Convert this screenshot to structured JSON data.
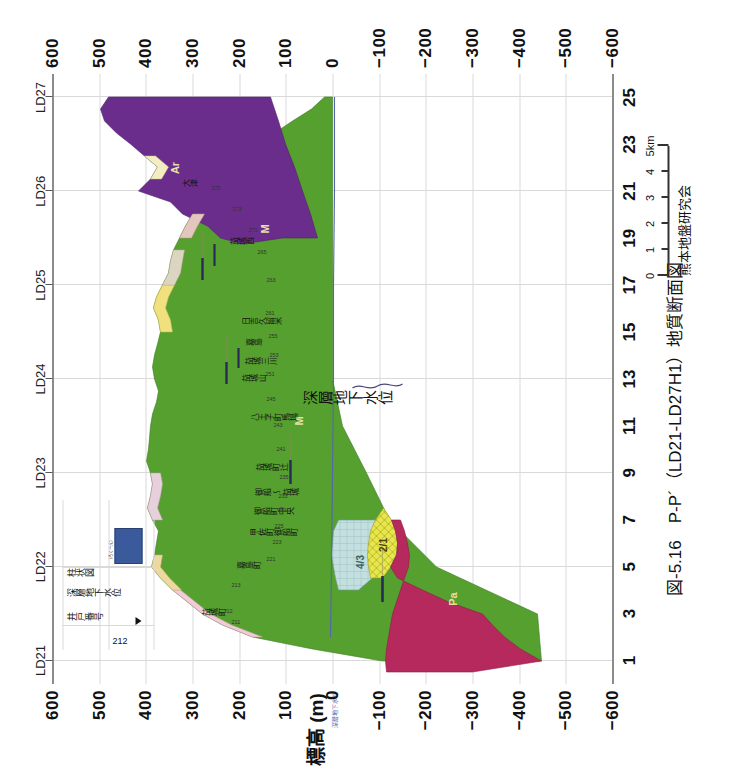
{
  "figure": {
    "caption": "図-5.16　P-P´（LD21-LD27H1）地質断面図",
    "organization": "熊本地盤研究会"
  },
  "axes": {
    "y_title": "標高 (m)",
    "y_ticks": [
      "600",
      "500",
      "400",
      "300",
      "200",
      "100",
      "0",
      "−100",
      "−200",
      "−300",
      "−400",
      "−500",
      "−600"
    ],
    "y_values": [
      600,
      500,
      400,
      300,
      200,
      100,
      0,
      -100,
      -200,
      -300,
      -400,
      -500,
      -600
    ],
    "y_range": [
      -600,
      600
    ],
    "x_ticks": [
      "1",
      "3",
      "5",
      "7",
      "9",
      "11",
      "13",
      "15",
      "17",
      "19",
      "21",
      "23",
      "25"
    ],
    "x_values": [
      1,
      3,
      5,
      7,
      9,
      11,
      13,
      15,
      17,
      19,
      21,
      23,
      25
    ],
    "x_range": [
      0,
      26
    ],
    "section_labels": [
      "LD21",
      "LD22",
      "LD23",
      "LD24",
      "LD25",
      "LD26",
      "LD27"
    ],
    "section_positions": [
      1,
      5,
      9,
      13,
      17,
      21,
      25
    ]
  },
  "scalebar": {
    "ticks": [
      "0",
      "1",
      "2",
      "3",
      "4",
      "5km"
    ],
    "values": [
      0,
      1,
      2,
      3,
      4,
      5
    ],
    "unit": "km"
  },
  "legend": {
    "well_number_label": "井戸番号",
    "well_number_value": "212",
    "groundwater_label": "深層地下水位",
    "column_label": "柱状図",
    "column_caption": "（ろくーん）",
    "swatch_color": "#3b5a9b"
  },
  "annotations": {
    "groundwater_callout": "深層地下水位",
    "groundwater_axis_note": "深層地下水位"
  },
  "units": [
    {
      "code": "Ar",
      "name": "阿蘇火砕流堆積物",
      "color": "#6B2D8C",
      "label_x": 22.0,
      "label_y": -40
    },
    {
      "code": "M",
      "name": "砥川溶岩・布田層",
      "color": "#56A030",
      "label_x": 19.4,
      "label_y": -90
    },
    {
      "code": "M",
      "name": "砥川溶岩・布田層",
      "color": "#56A030",
      "label_x": 11.2,
      "label_y": -130
    },
    {
      "code": "Pa",
      "name": "先阿蘇火山岩類",
      "color": "#B5295C",
      "label_x": 3.6,
      "label_y": -160
    },
    {
      "code": "4/3",
      "name": "第4/第3帯水層",
      "color": "#BFDCDC",
      "label_x": 5.2,
      "label_y": -40
    },
    {
      "code": "2/1",
      "name": "第2/第1帯水層",
      "color": "#E4E24A",
      "label_x": 5.9,
      "label_y": -118
    }
  ],
  "chart_data": {
    "type": "area",
    "title": "図-5.16　P-P´（LD21-LD27H1）地質断面図",
    "xlabel": "",
    "ylabel": "標高 (m)",
    "xlim": [
      0,
      26
    ],
    "ylim": [
      -600,
      600
    ],
    "grid": true,
    "legend_position": "inset-upper-left",
    "series": [
      {
        "name": "地表面（標高）",
        "unit": "m",
        "x": [
          2.0,
          2.4,
          2.8,
          3.2,
          3.6,
          4.0,
          4.4,
          4.8,
          5.2,
          5.6,
          6.0,
          6.6,
          7.2,
          7.8,
          8.4,
          9.0,
          9.6,
          10.2,
          10.8,
          11.4,
          12.0,
          12.6,
          13.2,
          13.8,
          14.4,
          15.0,
          15.6,
          16.2,
          16.8,
          17.4,
          18.0,
          18.6,
          19.2,
          19.8,
          20.4,
          21.0,
          21.6,
          22.2,
          22.8,
          23.4,
          24.0,
          24.6,
          25.2
        ],
        "y": [
          195,
          165,
          175,
          190,
          195,
          190,
          150,
          120,
          95,
          88,
          82,
          78,
          72,
          70,
          68,
          65,
          70,
          75,
          78,
          80,
          92,
          100,
          96,
          88,
          86,
          92,
          98,
          95,
          90,
          96,
          105,
          118,
          130,
          150,
          175,
          205,
          245,
          290,
          265,
          320,
          370,
          390,
          395
        ]
      },
      {
        "name": "阿蘇火砕流堆積物 (Ar) 基底",
        "unit": "m",
        "x": [
          19.0,
          20.0,
          21.0,
          22.0,
          23.0,
          24.0,
          25.2
        ],
        "y": [
          25,
          10,
          -10,
          -40,
          -80,
          -130,
          -185
        ]
      },
      {
        "name": "砥川溶岩・布田層 (M) 基底",
        "unit": "m",
        "x": [
          1.0,
          3.0,
          5.0,
          7.0,
          9.0,
          11.0,
          13.0,
          15.0,
          17.0,
          19.0,
          21.0,
          23.0,
          25.2
        ],
        "y": [
          -505,
          -500,
          -365,
          -290,
          -255,
          -205,
          -200,
          -200,
          -200,
          -200,
          -200,
          -200,
          -200
        ]
      },
      {
        "name": "先阿蘇火山岩類 (Pa) 上面",
        "unit": "m",
        "x": [
          1.0,
          2.0,
          3.0,
          4.0,
          5.0,
          5.6
        ],
        "y": [
          -500,
          -300,
          -220,
          -180,
          -150,
          -120
        ]
      },
      {
        "name": "深層地下水位",
        "unit": "m",
        "x": [
          2.0,
          5.0,
          9.0,
          13.0,
          17.0,
          21.0,
          25.0
        ],
        "y": [
          8,
          6,
          5,
          4,
          4,
          3,
          2
        ]
      }
    ]
  },
  "places": [
    {
      "label": "益城町",
      "x": 3.0
    },
    {
      "label": "嘉島町",
      "x": 5.0
    },
    {
      "label": "甲佐町御船町",
      "x": 6.4
    },
    {
      "label": "御船町中央",
      "x": 7.3
    },
    {
      "label": "御船 ～ 益城",
      "x": 8.1
    },
    {
      "label": "益城町辻",
      "x": 9.2
    },
    {
      "label": "八王子町馬場",
      "x": 11.3
    },
    {
      "label": "益城山",
      "x": 13.0
    },
    {
      "label": "益城三川",
      "x": 13.7
    },
    {
      "label": "嘉島",
      "x": 14.5
    },
    {
      "label": "日吉久留米",
      "x": 15.4
    },
    {
      "label": "益城西",
      "x": 18.8
    },
    {
      "label": "大津",
      "x": 21.3
    }
  ],
  "wells": [
    {
      "id": "211",
      "x": 2.6
    },
    {
      "id": "212",
      "x": 3.1
    },
    {
      "id": "213",
      "x": 4.2
    },
    {
      "id": "221",
      "x": 5.3
    },
    {
      "id": "223",
      "x": 6.0
    },
    {
      "id": "225",
      "x": 6.7
    },
    {
      "id": "231",
      "x": 7.4
    },
    {
      "id": "233",
      "x": 8.0
    },
    {
      "id": "235",
      "x": 8.8
    },
    {
      "id": "241",
      "x": 10.0
    },
    {
      "id": "243",
      "x": 11.0
    },
    {
      "id": "245",
      "x": 12.1
    },
    {
      "id": "251",
      "x": 13.2
    },
    {
      "id": "253",
      "x": 14.0
    },
    {
      "id": "255",
      "x": 14.8
    },
    {
      "id": "261",
      "x": 15.8
    },
    {
      "id": "263",
      "x": 17.2
    },
    {
      "id": "265",
      "x": 18.4
    },
    {
      "id": "271",
      "x": 19.3
    },
    {
      "id": "273",
      "x": 20.2
    },
    {
      "id": "275",
      "x": 21.1
    }
  ]
}
